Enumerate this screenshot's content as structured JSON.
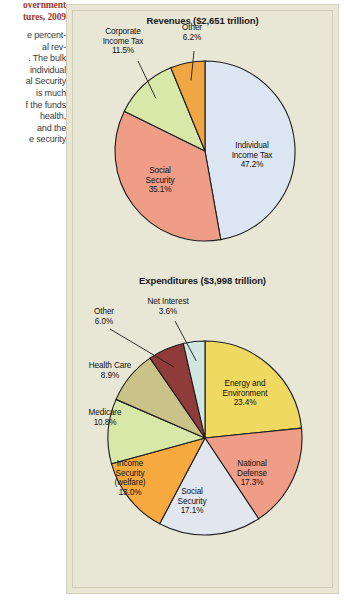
{
  "caption": {
    "title_lines": [
      "overnment",
      "tures, 2009"
    ],
    "body_lines": [
      "e percent-",
      "al rev-",
      ". The bulk",
      "individual",
      "al Security",
      "is much",
      "f the funds",
      "health,",
      "and the",
      "e security"
    ]
  },
  "chart_data": [
    {
      "type": "pie",
      "id": "revenues",
      "title": "Revenues ($2,651 trillion)",
      "unit": "%",
      "categories": [
        "Individual Income Tax",
        "Social Security",
        "Corporate Income Tax",
        "Other"
      ],
      "values": [
        47.2,
        35.1,
        11.5,
        6.2
      ],
      "labels": [
        "47.2%",
        "35.1%",
        "11.5%",
        "6.2%"
      ],
      "colors": [
        "#dce6f2",
        "#ef9d87",
        "#d7e8a8",
        "#f0a642"
      ],
      "legend": "none",
      "slices": [
        {
          "name": "Individual Income Tax",
          "label_lines": [
            "Individual",
            "Income Tax",
            "47.2%"
          ],
          "value": 47.2,
          "color": "#dce6f2",
          "label_placement": "inside"
        },
        {
          "name": "Social Security",
          "label_lines": [
            "Social",
            "Security",
            "35.1%"
          ],
          "value": 35.1,
          "color": "#ef9d87",
          "label_placement": "inside"
        },
        {
          "name": "Corporate Income Tax",
          "label_lines": [
            "Corporate",
            "Income Tax",
            "11.5%"
          ],
          "value": 11.5,
          "color": "#d7e8a8",
          "label_placement": "outside-leader"
        },
        {
          "name": "Other",
          "label_lines": [
            "Other",
            "6.2%"
          ],
          "value": 6.2,
          "color": "#f0a642",
          "label_placement": "outside-leader"
        }
      ]
    },
    {
      "type": "pie",
      "id": "expenditures",
      "title": "Expenditures ($3,998 trillion)",
      "unit": "%",
      "categories": [
        "Energy and Environment",
        "National Defense",
        "Social Security",
        "Income Security (welfare)",
        "Medicare",
        "Health Care",
        "Other",
        "Net Interest"
      ],
      "values": [
        23.4,
        17.3,
        17.1,
        13.0,
        10.8,
        8.9,
        6.0,
        3.6
      ],
      "labels": [
        "23.4%",
        "17.3%",
        "17.1%",
        "13.0%",
        "10.8%",
        "8.9%",
        "6.0%",
        "3.6%"
      ],
      "colors": [
        "#f0d960",
        "#ef9d87",
        "#e2e6ee",
        "#f5a93f",
        "#d7e8a8",
        "#c9c289",
        "#8e3b39",
        "#cfe7e0"
      ],
      "legend": "none",
      "slices": [
        {
          "name": "Energy and Environment",
          "label_lines": [
            "Energy and",
            "Environment",
            "23.4%"
          ],
          "value": 23.4,
          "color": "#f0d960",
          "label_placement": "inside"
        },
        {
          "name": "National Defense",
          "label_lines": [
            "National",
            "Defense",
            "17.3%"
          ],
          "value": 17.3,
          "color": "#ef9d87",
          "label_placement": "inside"
        },
        {
          "name": "Social Security",
          "label_lines": [
            "Social",
            "Security",
            "17.1%"
          ],
          "value": 17.1,
          "color": "#e2e6ee",
          "label_placement": "inside"
        },
        {
          "name": "Income Security (welfare)",
          "label_lines": [
            "Income",
            "Security",
            "(welfare)",
            "13.0%"
          ],
          "value": 13.0,
          "color": "#f5a93f",
          "label_placement": "inside"
        },
        {
          "name": "Medicare",
          "label_lines": [
            "Medicare",
            "10.8%"
          ],
          "value": 10.8,
          "color": "#d7e8a8",
          "label_placement": "inside"
        },
        {
          "name": "Health Care",
          "label_lines": [
            "Health Care",
            "8.9%"
          ],
          "value": 8.9,
          "color": "#c9c289",
          "label_placement": "inside"
        },
        {
          "name": "Other",
          "label_lines": [
            "Other",
            "6.0%"
          ],
          "value": 6.0,
          "color": "#8e3b39",
          "label_placement": "outside-leader"
        },
        {
          "name": "Net Interest",
          "label_lines": [
            "Net Interest",
            "3.6%"
          ],
          "value": 3.6,
          "color": "#cfe7e0",
          "label_placement": "outside-leader"
        }
      ]
    }
  ]
}
